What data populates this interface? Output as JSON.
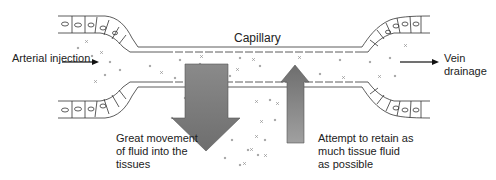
{
  "diagram": {
    "labels": {
      "capillary": "Capillary",
      "arterial_injection": "Arterial injection",
      "vein_drainage_line1": "Vein",
      "vein_drainage_line2": "drainage",
      "great_movement_line1": "Great movement",
      "great_movement_line2": "of fluid into the",
      "great_movement_line3": "tissues",
      "attempt_retain_line1": "Attempt to retain as",
      "attempt_retain_line2": "much tissue fluid",
      "attempt_retain_line3": "as possible"
    },
    "arrows": {
      "down_arrow": "fluid-out-of-capillary",
      "up_arrow": "fluid-back-into-capillary"
    },
    "colors": {
      "arrow_fill": "#7a7a7a",
      "arrow_light": "#9a9a9a",
      "line": "#333333",
      "particles": "#888888"
    }
  }
}
